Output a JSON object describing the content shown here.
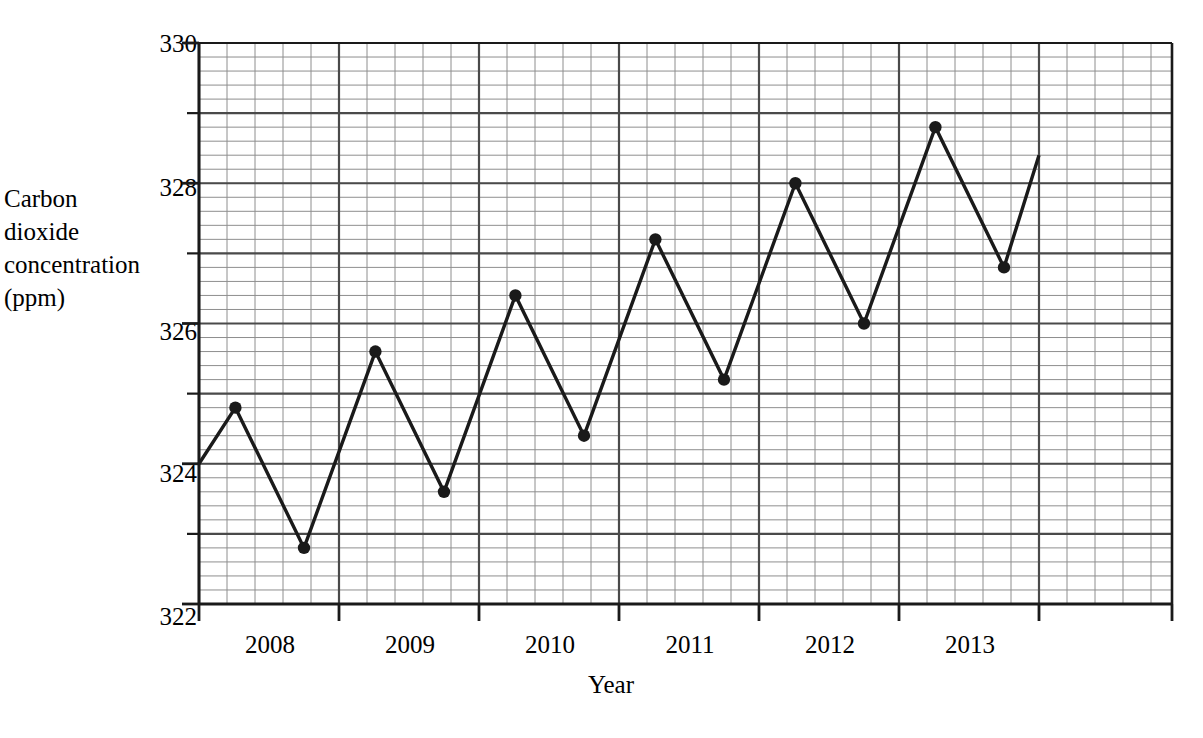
{
  "chart_data": {
    "type": "line",
    "title": "",
    "xlabel": "Year",
    "ylabel": "Carbon dioxide concentration (ppm)",
    "ylabel_lines": "Carbon\ndioxide\nconcentration\n(ppm)",
    "xlim": [
      2008.0,
      2014.95
    ],
    "ylim": [
      322,
      330
    ],
    "y_ticks_labeled": [
      322,
      324,
      326,
      328,
      330
    ],
    "y_ticks_major": [
      322,
      323,
      324,
      325,
      326,
      327,
      328,
      329,
      330
    ],
    "y_major_step": 1,
    "y_minor_step": 0.2,
    "y_minor_per_major": 5,
    "x_ticks_major": [
      2008.0,
      2009.0,
      2010.0,
      2011.0,
      2012.0,
      2013.0,
      2014.0
    ],
    "x_tick_labels": [
      "2008",
      "2009",
      "2010",
      "2011",
      "2012",
      "2013"
    ],
    "x_major_step": 1,
    "x_minor_step": 0.2,
    "x_minor_per_major": 5,
    "grid": true,
    "grid_style": "graph-paper major and minor",
    "legend": "none",
    "line_color": "#1a1a1a",
    "marker": "filled-circle",
    "series": [
      {
        "name": "Carbon dioxide concentration",
        "x": [
          2008.0,
          2008.26,
          2008.75,
          2009.26,
          2009.75,
          2010.26,
          2010.75,
          2011.26,
          2011.75,
          2012.26,
          2012.75,
          2013.26,
          2013.75
        ],
        "values": [
          324.0,
          324.8,
          322.8,
          325.6,
          323.6,
          326.4,
          324.4,
          327.2,
          325.2,
          328.0,
          326.0,
          328.8,
          326.8
        ],
        "marker_shown": [
          false,
          true,
          true,
          true,
          true,
          true,
          true,
          true,
          true,
          true,
          true,
          true,
          true
        ],
        "end_x": 2014.0,
        "end_value": 328.4
      }
    ]
  },
  "axes": {
    "y_labels": [
      {
        "value": "330",
        "ppm": 330
      },
      {
        "value": "328",
        "ppm": 328
      },
      {
        "value": "326",
        "ppm": 326
      },
      {
        "value": "324",
        "ppm": 324
      },
      {
        "value": "322",
        "ppm": 322
      }
    ],
    "x_labels": [
      {
        "value": "2008",
        "year": 2008
      },
      {
        "value": "2009",
        "year": 2009
      },
      {
        "value": "2010",
        "year": 2010
      },
      {
        "value": "2011",
        "year": 2011
      },
      {
        "value": "2012",
        "year": 2012
      },
      {
        "value": "2013",
        "year": 2013
      }
    ],
    "y_title": "Carbon\ndioxide\nconcentration\n(ppm)",
    "x_title": "Year"
  },
  "colors": {
    "line": "#1a1a1a",
    "axis": "#1a1a1a",
    "grid_major": "#4a4a4a",
    "grid_minor": "#8e8e8e",
    "background": "#ffffff"
  }
}
